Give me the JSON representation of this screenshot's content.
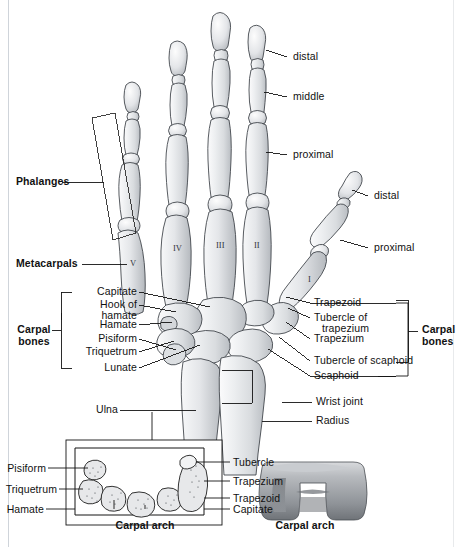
{
  "figure": {
    "background": "#ffffff",
    "bone_fill": "#e9eaec",
    "bone_outline": "#3a3f45",
    "leader_color": "#1a1a1a",
    "arch_fill": "#9a9ea3"
  },
  "group_labels": {
    "phalanges": "Phalanges",
    "metacarpals": "Metacarpals",
    "carpal_bones_left": "Carpal\nbones",
    "carpal_bones_left_line1": "Carpal",
    "carpal_bones_left_line2": "bones",
    "carpal_bones_right_line1": "Carpal",
    "carpal_bones_right_line2": "bones"
  },
  "finger_labels": {
    "distal": "distal",
    "middle": "middle",
    "proximal": "proximal",
    "thumb_distal": "distal",
    "thumb_proximal": "proximal"
  },
  "metacarpal_numerals": [
    "I",
    "II",
    "III",
    "IV",
    "V"
  ],
  "left_carpal_labels": [
    "Capitate",
    "Hook of",
    "hamate",
    "Hamate",
    "Pisiform",
    "Triquetrum",
    "Lunate"
  ],
  "left_carpal_list": [
    {
      "text": "Capitate"
    },
    {
      "text": "Hook of"
    },
    {
      "text": "hamate"
    },
    {
      "text": "Hamate"
    },
    {
      "text": "Pisiform"
    },
    {
      "text": "Triquetrum"
    },
    {
      "text": "Lunate"
    }
  ],
  "right_carpal_list": [
    {
      "text": "Trapezoid"
    },
    {
      "text": "Tubercle of"
    },
    {
      "text": "trapezium"
    },
    {
      "text": "Trapezium"
    },
    {
      "text": "Tubercle of scaphoid"
    },
    {
      "text": "Scaphoid"
    }
  ],
  "forearm_labels": {
    "ulna": "Ulna",
    "radius": "Radius",
    "wrist_joint": "Wrist joint"
  },
  "inset_cross_section": {
    "caption": "Carpal arch",
    "left_labels": [
      "Pisiform",
      "Triquetrum",
      "Hamate"
    ],
    "right_labels": [
      "Tubercle",
      "Trapezium",
      "Trapezoid",
      "Capitate"
    ]
  },
  "inset_arch_3d": {
    "caption": "Carpal arch"
  }
}
